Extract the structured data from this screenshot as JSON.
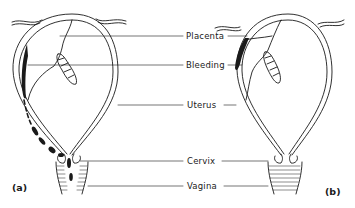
{
  "figure": {
    "labels": {
      "placenta": "Placenta",
      "bleeding": "Bleeding",
      "uterus": "Uterus",
      "cervix": "Cervix",
      "vagina": "Vagina"
    },
    "panels": {
      "a": "(a)",
      "b": "(b)"
    },
    "colors": {
      "ink": "#1a1a1a",
      "background": "#ffffff"
    }
  }
}
